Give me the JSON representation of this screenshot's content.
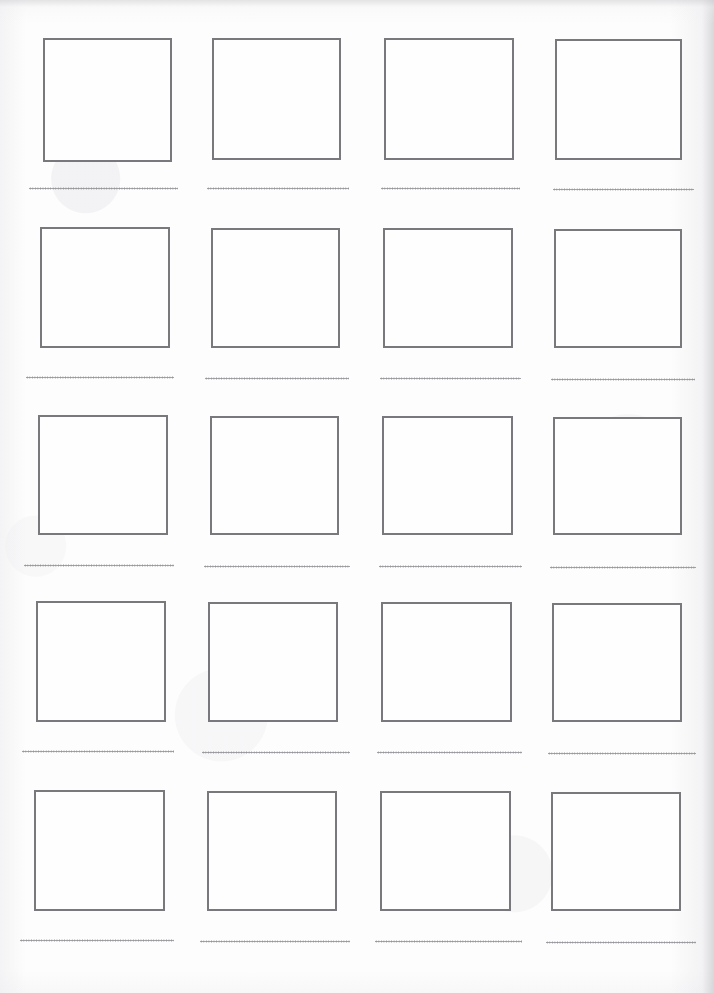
{
  "document": {
    "kind": "scanned-worksheet-page",
    "title": "Blank picture-and-line worksheet",
    "page_width": 714,
    "page_height": 993,
    "background_color": "#fdfdfd",
    "box_border_color": "#78787d",
    "box_border_width": 2,
    "rule_color": "#8b8b90",
    "columns": 4,
    "rows": 5,
    "total_cells": 20
  },
  "grid": {
    "column_x": [
      43,
      212,
      384,
      555
    ],
    "row_y": [
      38,
      227,
      415,
      601,
      790
    ],
    "box_width": 129,
    "box_height": 124,
    "rule_offset_y": 149,
    "cells": [
      {
        "id": "cell-r1c1",
        "row": 1,
        "col": 1,
        "x": 43,
        "y": 38,
        "w": 129,
        "h": 124,
        "rule_x": 29,
        "rule_w": 149,
        "box_label": "",
        "line_text": ""
      },
      {
        "id": "cell-r1c2",
        "row": 1,
        "col": 2,
        "x": 212,
        "y": 38,
        "w": 129,
        "h": 122,
        "rule_x": 207,
        "rule_w": 142,
        "box_label": "",
        "line_text": ""
      },
      {
        "id": "cell-r1c3",
        "row": 1,
        "col": 3,
        "x": 384,
        "y": 38,
        "w": 130,
        "h": 122,
        "rule_x": 381,
        "rule_w": 139,
        "box_label": "",
        "line_text": ""
      },
      {
        "id": "cell-r1c4",
        "row": 1,
        "col": 4,
        "x": 555,
        "y": 39,
        "w": 127,
        "h": 121,
        "rule_x": 553,
        "rule_w": 141,
        "box_label": "",
        "line_text": ""
      },
      {
        "id": "cell-r2c1",
        "row": 2,
        "col": 1,
        "x": 40,
        "y": 227,
        "w": 130,
        "h": 121,
        "rule_x": 26,
        "rule_w": 148,
        "box_label": "",
        "line_text": ""
      },
      {
        "id": "cell-r2c2",
        "row": 2,
        "col": 2,
        "x": 211,
        "y": 228,
        "w": 129,
        "h": 120,
        "rule_x": 205,
        "rule_w": 144,
        "box_label": "",
        "line_text": ""
      },
      {
        "id": "cell-r2c3",
        "row": 2,
        "col": 3,
        "x": 383,
        "y": 228,
        "w": 130,
        "h": 120,
        "rule_x": 380,
        "rule_w": 141,
        "box_label": "",
        "line_text": ""
      },
      {
        "id": "cell-r2c4",
        "row": 2,
        "col": 4,
        "x": 554,
        "y": 229,
        "w": 128,
        "h": 119,
        "rule_x": 551,
        "rule_w": 144,
        "box_label": "",
        "line_text": ""
      },
      {
        "id": "cell-r3c1",
        "row": 3,
        "col": 1,
        "x": 38,
        "y": 415,
        "w": 130,
        "h": 120,
        "rule_x": 24,
        "rule_w": 150,
        "box_label": "",
        "line_text": ""
      },
      {
        "id": "cell-r3c2",
        "row": 3,
        "col": 2,
        "x": 210,
        "y": 416,
        "w": 129,
        "h": 119,
        "rule_x": 204,
        "rule_w": 146,
        "box_label": "",
        "line_text": ""
      },
      {
        "id": "cell-r3c3",
        "row": 3,
        "col": 3,
        "x": 382,
        "y": 416,
        "w": 131,
        "h": 119,
        "rule_x": 379,
        "rule_w": 143,
        "box_label": "",
        "line_text": ""
      },
      {
        "id": "cell-r3c4",
        "row": 3,
        "col": 4,
        "x": 553,
        "y": 417,
        "w": 129,
        "h": 118,
        "rule_x": 550,
        "rule_w": 146,
        "box_label": "",
        "line_text": ""
      },
      {
        "id": "cell-r4c1",
        "row": 4,
        "col": 1,
        "x": 36,
        "y": 601,
        "w": 130,
        "h": 121,
        "rule_x": 22,
        "rule_w": 152,
        "box_label": "",
        "line_text": ""
      },
      {
        "id": "cell-r4c2",
        "row": 4,
        "col": 2,
        "x": 208,
        "y": 602,
        "w": 130,
        "h": 120,
        "rule_x": 202,
        "rule_w": 148,
        "box_label": "",
        "line_text": ""
      },
      {
        "id": "cell-r4c3",
        "row": 4,
        "col": 3,
        "x": 381,
        "y": 602,
        "w": 131,
        "h": 120,
        "rule_x": 377,
        "rule_w": 145,
        "box_label": "",
        "line_text": ""
      },
      {
        "id": "cell-r4c4",
        "row": 4,
        "col": 4,
        "x": 552,
        "y": 603,
        "w": 130,
        "h": 119,
        "rule_x": 548,
        "rule_w": 148,
        "box_label": "",
        "line_text": ""
      },
      {
        "id": "cell-r5c1",
        "row": 5,
        "col": 1,
        "x": 34,
        "y": 790,
        "w": 131,
        "h": 121,
        "rule_x": 20,
        "rule_w": 154,
        "box_label": "",
        "line_text": ""
      },
      {
        "id": "cell-r5c2",
        "row": 5,
        "col": 2,
        "x": 207,
        "y": 791,
        "w": 130,
        "h": 120,
        "rule_x": 200,
        "rule_w": 150,
        "box_label": "",
        "line_text": ""
      },
      {
        "id": "cell-r5c3",
        "row": 5,
        "col": 3,
        "x": 380,
        "y": 791,
        "w": 131,
        "h": 120,
        "rule_x": 375,
        "rule_w": 147,
        "box_label": "",
        "line_text": ""
      },
      {
        "id": "cell-r5c4",
        "row": 5,
        "col": 4,
        "x": 551,
        "y": 792,
        "w": 130,
        "h": 119,
        "rule_x": 546,
        "rule_w": 150,
        "box_label": "",
        "line_text": ""
      }
    ]
  }
}
